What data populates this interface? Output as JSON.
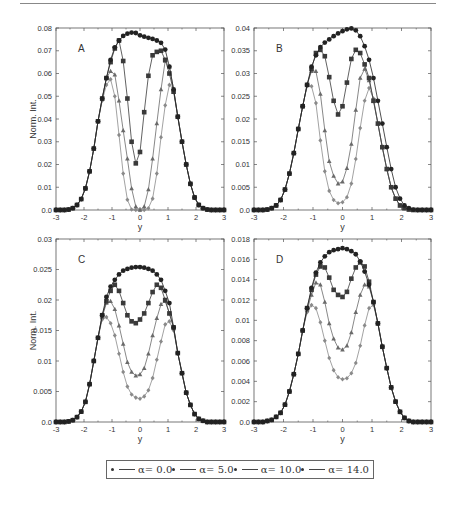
{
  "legend": {
    "items": [
      {
        "label": "α= 0.0",
        "color": "#222222",
        "marker": "circle"
      },
      {
        "label": "α= 5.0",
        "color": "#3a3a3a",
        "marker": "square"
      },
      {
        "label": "α= 10.0",
        "color": "#6a6a6a",
        "marker": "triangle"
      },
      {
        "label": "α= 14.0",
        "color": "#8a8a8a",
        "marker": "diamond"
      }
    ]
  },
  "chart_data": [
    {
      "panel": "A",
      "type": "line",
      "title": "",
      "xlabel": "y",
      "ylabel": "Norm. Int.",
      "xlim": [
        -3,
        3
      ],
      "ylim": [
        0,
        0.08
      ],
      "xticks": [
        -3,
        -2,
        -1,
        0,
        1,
        2,
        3
      ],
      "yticks": [
        0.0,
        0.01,
        0.02,
        0.03,
        0.04,
        0.05,
        0.06,
        0.07,
        0.08
      ],
      "ytick_labels": [
        "0.0",
        "0.01",
        "0.02",
        "0.03",
        "0.04",
        "0.05",
        "0.06",
        "0.07",
        "0.08"
      ],
      "grid": false,
      "frame": {
        "left": 56,
        "top": 28,
        "right": 224,
        "bottom": 210
      },
      "x": [
        -3.0,
        -2.85,
        -2.7,
        -2.55,
        -2.4,
        -2.25,
        -2.1,
        -1.95,
        -1.8,
        -1.65,
        -1.5,
        -1.35,
        -1.2,
        -1.05,
        -0.9,
        -0.75,
        -0.6,
        -0.45,
        -0.3,
        -0.15,
        0.0,
        0.15,
        0.3,
        0.45,
        0.6,
        0.75,
        0.9,
        1.05,
        1.2,
        1.35,
        1.5,
        1.65,
        1.8,
        1.95,
        2.1,
        2.25,
        2.4,
        2.55,
        2.7,
        2.85,
        3.0
      ],
      "series": [
        {
          "name": "α= 0.0",
          "values": [
            0.0,
            0.0,
            0.0,
            0.0002,
            0.0008,
            0.0022,
            0.0048,
            0.0095,
            0.017,
            0.027,
            0.039,
            0.049,
            0.058,
            0.066,
            0.0715,
            0.0745,
            0.0765,
            0.0775,
            0.078,
            0.0778,
            0.0768,
            0.0762,
            0.0757,
            0.0752,
            0.0745,
            0.0735,
            0.0705,
            0.063,
            0.053,
            0.041,
            0.03,
            0.02,
            0.0115,
            0.0055,
            0.0022,
            0.0008,
            0.0002,
            0.0,
            0.0,
            0.0,
            0.0
          ]
        },
        {
          "name": "α= 5.0",
          "values": [
            0.0,
            0.0,
            0.0,
            0.0002,
            0.0008,
            0.0022,
            0.0048,
            0.0095,
            0.017,
            0.027,
            0.039,
            0.049,
            0.058,
            0.065,
            0.071,
            0.0745,
            0.0655,
            0.049,
            0.03,
            0.0205,
            0.0255,
            0.043,
            0.059,
            0.068,
            0.0695,
            0.07,
            0.066,
            0.06,
            0.052,
            0.041,
            0.03,
            0.02,
            0.0115,
            0.0055,
            0.0022,
            0.0008,
            0.0002,
            0.0,
            0.0,
            0.0,
            0.0
          ]
        },
        {
          "name": "α= 10.0",
          "values": [
            0.0,
            0.0,
            0.0,
            0.0002,
            0.0008,
            0.0022,
            0.0048,
            0.0095,
            0.017,
            0.027,
            0.039,
            0.049,
            0.058,
            0.061,
            0.0595,
            0.048,
            0.035,
            0.0225,
            0.0095,
            0.0015,
            0.0,
            0.0015,
            0.009,
            0.0225,
            0.038,
            0.053,
            0.0655,
            0.063,
            0.053,
            0.041,
            0.03,
            0.02,
            0.0115,
            0.0055,
            0.0022,
            0.0008,
            0.0002,
            0.0,
            0.0,
            0.0,
            0.0
          ]
        },
        {
          "name": "α= 14.0",
          "values": [
            0.0,
            0.0,
            0.0,
            0.0002,
            0.0008,
            0.0022,
            0.0048,
            0.0095,
            0.017,
            0.027,
            0.039,
            0.048,
            0.055,
            0.0575,
            0.05,
            0.033,
            0.016,
            0.0045,
            0.0002,
            0.0,
            0.0,
            0.0,
            0.0008,
            0.005,
            0.016,
            0.032,
            0.046,
            0.055,
            0.053,
            0.041,
            0.03,
            0.02,
            0.0115,
            0.0055,
            0.0022,
            0.0008,
            0.0002,
            0.0,
            0.0,
            0.0,
            0.0
          ]
        }
      ]
    },
    {
      "panel": "B",
      "type": "line",
      "title": "",
      "xlabel": "y",
      "ylabel": "",
      "xlim": [
        -3,
        3
      ],
      "ylim": [
        0,
        0.04
      ],
      "xticks": [
        -3,
        -2,
        -1,
        0,
        1,
        2,
        3
      ],
      "yticks": [
        0.0,
        0.005,
        0.01,
        0.015,
        0.02,
        0.025,
        0.03,
        0.035,
        0.04
      ],
      "ytick_labels": [
        "0.0",
        "0.005",
        "0.01",
        "0.015",
        "0.02",
        "0.025",
        "0.03",
        "0.035",
        "0.04"
      ],
      "grid": false,
      "frame": {
        "left": 254,
        "top": 28,
        "right": 431,
        "bottom": 210
      },
      "x": [
        -3.0,
        -2.85,
        -2.7,
        -2.55,
        -2.4,
        -2.25,
        -2.1,
        -1.95,
        -1.8,
        -1.65,
        -1.5,
        -1.35,
        -1.2,
        -1.05,
        -0.9,
        -0.75,
        -0.6,
        -0.45,
        -0.3,
        -0.15,
        0.0,
        0.15,
        0.3,
        0.45,
        0.6,
        0.75,
        0.9,
        1.05,
        1.2,
        1.35,
        1.5,
        1.65,
        1.8,
        1.95,
        2.1,
        2.25,
        2.4,
        2.55,
        2.7,
        2.85,
        3.0
      ],
      "series": [
        {
          "name": "α= 0.0",
          "values": [
            0.0,
            0.0,
            0.0,
            0.0001,
            0.0004,
            0.001,
            0.0022,
            0.0045,
            0.008,
            0.0125,
            0.0178,
            0.0228,
            0.0275,
            0.0315,
            0.034,
            0.0358,
            0.0368,
            0.0375,
            0.0382,
            0.0388,
            0.0393,
            0.0397,
            0.0399,
            0.0395,
            0.0382,
            0.036,
            0.033,
            0.029,
            0.024,
            0.019,
            0.0138,
            0.009,
            0.005,
            0.0025,
            0.001,
            0.0004,
            0.0001,
            0.0,
            0.0,
            0.0,
            0.0
          ]
        },
        {
          "name": "α= 5.0",
          "values": [
            0.0,
            0.0,
            0.0,
            0.0001,
            0.0004,
            0.001,
            0.0022,
            0.0045,
            0.008,
            0.0125,
            0.0178,
            0.0228,
            0.0275,
            0.031,
            0.0345,
            0.0352,
            0.0338,
            0.0292,
            0.024,
            0.021,
            0.0228,
            0.028,
            0.0332,
            0.0352,
            0.0345,
            0.032,
            0.029,
            0.024,
            0.019,
            0.0138,
            0.009,
            0.005,
            0.0025,
            0.001,
            0.0004,
            0.0001,
            0.0,
            0.0,
            0.0,
            0.0,
            0.0
          ]
        },
        {
          "name": "α= 10.0",
          "values": [
            0.0,
            0.0,
            0.0,
            0.0001,
            0.0004,
            0.001,
            0.0022,
            0.0045,
            0.008,
            0.0125,
            0.0178,
            0.0228,
            0.0275,
            0.0305,
            0.0305,
            0.0255,
            0.0175,
            0.0107,
            0.0075,
            0.0058,
            0.0062,
            0.0092,
            0.0145,
            0.022,
            0.029,
            0.031,
            0.0285,
            0.024,
            0.019,
            0.0138,
            0.009,
            0.005,
            0.0025,
            0.001,
            0.0004,
            0.0001,
            0.0,
            0.0,
            0.0,
            0.0,
            0.0
          ]
        },
        {
          "name": "α= 14.0",
          "values": [
            0.0,
            0.0,
            0.0,
            0.0001,
            0.0004,
            0.001,
            0.0022,
            0.0045,
            0.008,
            0.0125,
            0.0178,
            0.0228,
            0.0272,
            0.0272,
            0.0235,
            0.0153,
            0.0085,
            0.0042,
            0.0022,
            0.0015,
            0.0017,
            0.0028,
            0.0058,
            0.0112,
            0.018,
            0.024,
            0.0268,
            0.0245,
            0.019,
            0.0138,
            0.009,
            0.005,
            0.0025,
            0.001,
            0.0004,
            0.0001,
            0.0,
            0.0,
            0.0,
            0.0,
            0.0
          ]
        }
      ]
    },
    {
      "panel": "C",
      "type": "line",
      "title": "",
      "xlabel": "y",
      "ylabel": "Norm. Int.",
      "xlim": [
        -3,
        3
      ],
      "ylim": [
        0,
        0.03
      ],
      "xticks": [
        -3,
        -2,
        -1,
        0,
        1,
        2,
        3
      ],
      "yticks": [
        0.0,
        0.005,
        0.01,
        0.015,
        0.02,
        0.025,
        0.03
      ],
      "ytick_labels": [
        "0.0",
        "0.005",
        "0.01",
        "0.015",
        "0.02",
        "0.025",
        "0.03"
      ],
      "grid": false,
      "frame": {
        "left": 56,
        "top": 239,
        "right": 224,
        "bottom": 422
      },
      "x": [
        -3.0,
        -2.85,
        -2.7,
        -2.55,
        -2.4,
        -2.25,
        -2.1,
        -1.95,
        -1.8,
        -1.65,
        -1.5,
        -1.35,
        -1.2,
        -1.05,
        -0.9,
        -0.75,
        -0.6,
        -0.45,
        -0.3,
        -0.15,
        0.0,
        0.15,
        0.3,
        0.45,
        0.6,
        0.75,
        0.9,
        1.05,
        1.2,
        1.35,
        1.5,
        1.65,
        1.8,
        1.95,
        2.1,
        2.25,
        2.4,
        2.55,
        2.7,
        2.85,
        3.0
      ],
      "series": [
        {
          "name": "α= 0.0",
          "values": [
            0.0,
            0.0,
            0.0,
            0.0001,
            0.0003,
            0.0008,
            0.0017,
            0.0033,
            0.0062,
            0.01,
            0.0138,
            0.0175,
            0.0205,
            0.0222,
            0.0233,
            0.0242,
            0.0248,
            0.0251,
            0.0253,
            0.0254,
            0.0254,
            0.0253,
            0.0251,
            0.0248,
            0.0242,
            0.0233,
            0.0215,
            0.0195,
            0.0155,
            0.0113,
            0.008,
            0.0048,
            0.0028,
            0.0013,
            0.0005,
            0.0002,
            0.0,
            0.0,
            0.0,
            0.0,
            0.0
          ]
        },
        {
          "name": "α= 5.0",
          "values": [
            0.0,
            0.0,
            0.0,
            0.0001,
            0.0003,
            0.0008,
            0.0017,
            0.0033,
            0.0062,
            0.01,
            0.0138,
            0.0175,
            0.0198,
            0.0215,
            0.0225,
            0.0215,
            0.0195,
            0.0175,
            0.0165,
            0.0162,
            0.0168,
            0.0178,
            0.0195,
            0.0213,
            0.0225,
            0.022,
            0.02,
            0.0178,
            0.0155,
            0.0113,
            0.008,
            0.0048,
            0.0028,
            0.0013,
            0.0005,
            0.0002,
            0.0,
            0.0,
            0.0,
            0.0,
            0.0
          ]
        },
        {
          "name": "α= 10.0",
          "values": [
            0.0,
            0.0,
            0.0,
            0.0001,
            0.0003,
            0.0008,
            0.0017,
            0.0033,
            0.0062,
            0.01,
            0.0138,
            0.0172,
            0.0195,
            0.0198,
            0.0185,
            0.0158,
            0.0128,
            0.0098,
            0.0082,
            0.0076,
            0.0078,
            0.0088,
            0.0112,
            0.0142,
            0.017,
            0.0193,
            0.0198,
            0.0178,
            0.0155,
            0.0113,
            0.008,
            0.0048,
            0.0028,
            0.0013,
            0.0005,
            0.0002,
            0.0,
            0.0,
            0.0,
            0.0,
            0.0
          ]
        },
        {
          "name": "α= 14.0",
          "values": [
            0.0,
            0.0,
            0.0,
            0.0001,
            0.0003,
            0.0008,
            0.0017,
            0.0033,
            0.0062,
            0.01,
            0.0138,
            0.0168,
            0.0172,
            0.0162,
            0.0142,
            0.0112,
            0.0082,
            0.0058,
            0.0045,
            0.004,
            0.0038,
            0.0042,
            0.0052,
            0.0072,
            0.0102,
            0.0132,
            0.016,
            0.0165,
            0.015,
            0.0113,
            0.008,
            0.0048,
            0.0028,
            0.0013,
            0.0005,
            0.0002,
            0.0,
            0.0,
            0.0,
            0.0,
            0.0
          ]
        }
      ]
    },
    {
      "panel": "D",
      "type": "line",
      "title": "",
      "xlabel": "y",
      "ylabel": "",
      "xlim": [
        -3,
        3
      ],
      "ylim": [
        0,
        0.018
      ],
      "xticks": [
        -3,
        -2,
        -1,
        0,
        1,
        2,
        3
      ],
      "yticks": [
        0.0,
        0.002,
        0.004,
        0.006,
        0.008,
        0.01,
        0.012,
        0.014,
        0.016,
        0.018
      ],
      "ytick_labels": [
        "0.0",
        "0.002",
        "0.004",
        "0.006",
        "0.008",
        "0.01",
        "0.012",
        "0.014",
        "0.016",
        "0.018"
      ],
      "grid": false,
      "frame": {
        "left": 254,
        "top": 239,
        "right": 431,
        "bottom": 422
      },
      "x": [
        -3.0,
        -2.85,
        -2.7,
        -2.55,
        -2.4,
        -2.25,
        -2.1,
        -1.95,
        -1.8,
        -1.65,
        -1.5,
        -1.35,
        -1.2,
        -1.05,
        -0.9,
        -0.75,
        -0.6,
        -0.45,
        -0.3,
        -0.15,
        0.0,
        0.15,
        0.3,
        0.45,
        0.6,
        0.75,
        0.9,
        1.05,
        1.2,
        1.35,
        1.5,
        1.65,
        1.8,
        1.95,
        2.1,
        2.25,
        2.4,
        2.55,
        2.7,
        2.85,
        3.0
      ],
      "series": [
        {
          "name": "α= 0.0",
          "values": [
            0.0,
            0.0,
            0.0,
            0.0001,
            0.0002,
            0.0005,
            0.0009,
            0.0017,
            0.003,
            0.0047,
            0.0067,
            0.009,
            0.0112,
            0.0132,
            0.0147,
            0.0157,
            0.0163,
            0.0167,
            0.0169,
            0.017,
            0.0171,
            0.017,
            0.0168,
            0.0165,
            0.0158,
            0.0148,
            0.0135,
            0.0118,
            0.0097,
            0.0074,
            0.0053,
            0.0034,
            0.002,
            0.001,
            0.0004,
            0.0001,
            0.0,
            0.0,
            0.0,
            0.0,
            0.0
          ]
        },
        {
          "name": "α= 5.0",
          "values": [
            0.0,
            0.0,
            0.0,
            0.0001,
            0.0002,
            0.0005,
            0.0009,
            0.0017,
            0.003,
            0.0047,
            0.0067,
            0.009,
            0.0112,
            0.013,
            0.0145,
            0.0153,
            0.0152,
            0.0142,
            0.013,
            0.0125,
            0.0123,
            0.0128,
            0.0141,
            0.0152,
            0.0157,
            0.0153,
            0.0138,
            0.0118,
            0.0097,
            0.0074,
            0.0053,
            0.0034,
            0.002,
            0.001,
            0.0004,
            0.0001,
            0.0,
            0.0,
            0.0,
            0.0,
            0.0
          ]
        },
        {
          "name": "α= 10.0",
          "values": [
            0.0,
            0.0,
            0.0,
            0.0001,
            0.0002,
            0.0005,
            0.0009,
            0.0017,
            0.003,
            0.0047,
            0.0067,
            0.009,
            0.011,
            0.0125,
            0.0137,
            0.0135,
            0.0118,
            0.0097,
            0.0082,
            0.0073,
            0.0071,
            0.0075,
            0.0088,
            0.0108,
            0.0125,
            0.0135,
            0.0133,
            0.0118,
            0.0097,
            0.0074,
            0.0053,
            0.0034,
            0.002,
            0.001,
            0.0004,
            0.0001,
            0.0,
            0.0,
            0.0,
            0.0,
            0.0
          ]
        },
        {
          "name": "α= 14.0",
          "values": [
            0.0,
            0.0,
            0.0,
            0.0001,
            0.0002,
            0.0005,
            0.0009,
            0.0017,
            0.003,
            0.0047,
            0.0067,
            0.009,
            0.0108,
            0.0115,
            0.0112,
            0.0098,
            0.008,
            0.0063,
            0.0051,
            0.0044,
            0.0042,
            0.0043,
            0.0048,
            0.0058,
            0.0075,
            0.0095,
            0.0112,
            0.0115,
            0.0097,
            0.0074,
            0.0053,
            0.0034,
            0.002,
            0.001,
            0.0004,
            0.0001,
            0.0,
            0.0,
            0.0,
            0.0,
            0.0
          ]
        }
      ]
    }
  ]
}
